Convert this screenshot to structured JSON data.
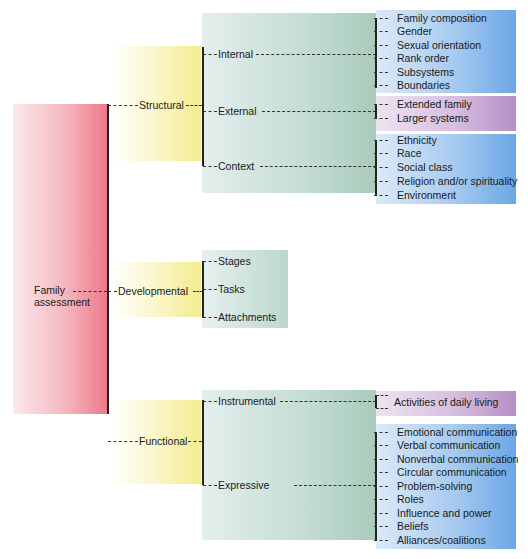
{
  "root": {
    "label": "Family assessment"
  },
  "categories": [
    {
      "label": "Structural",
      "subcategories": [
        {
          "label": "Internal",
          "items": [
            "Family composition",
            "Gender",
            "Sexual orientation",
            "Rank order",
            "Subsystems",
            "Boundaries"
          ],
          "color": "blue"
        },
        {
          "label": "External",
          "items": [
            "Extended family",
            "Larger systems"
          ],
          "color": "purple"
        },
        {
          "label": "Context",
          "items": [
            "Ethnicity",
            "Race",
            "Social class",
            "Religion and/or spirituality",
            "Environment"
          ],
          "color": "blue"
        }
      ]
    },
    {
      "label": "Developmental",
      "subcategories": [
        {
          "label": "Stages"
        },
        {
          "label": "Tasks"
        },
        {
          "label": "Attachments"
        }
      ]
    },
    {
      "label": "Functional",
      "subcategories": [
        {
          "label": "Instrumental",
          "items": [
            "Activities of daily living"
          ],
          "color": "purple"
        },
        {
          "label": "Expressive",
          "items": [
            "Emotional communication",
            "Verbal communication",
            "Nonverbal communication",
            "Circular communication",
            "Problem-solving",
            "Roles",
            "Influence and power",
            "Beliefs",
            "Alliances/coalitions"
          ],
          "color": "blue"
        }
      ]
    }
  ],
  "colors": {
    "root": "#ec7a88",
    "level1": "#f3ec8e",
    "level2": "#a9cbbc",
    "blue_leaf": "#6aa7e6",
    "purple_leaf": "#b58fc6",
    "line": "#222222"
  }
}
